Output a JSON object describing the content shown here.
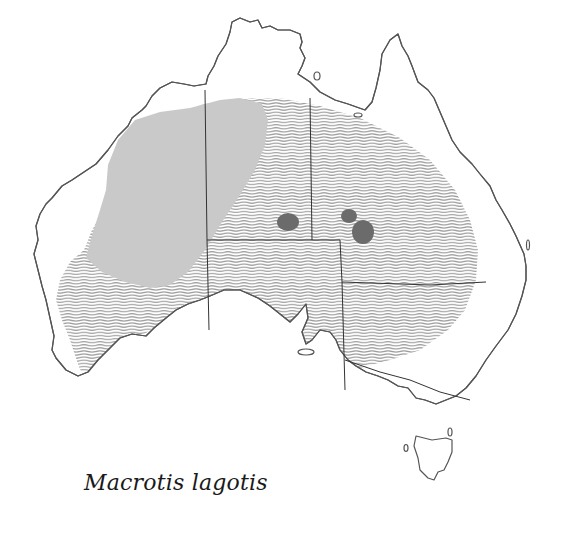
{
  "title": "Macrotis lagotis",
  "caption": "Macrotis lagotis",
  "map": {
    "region": "Australia",
    "legend_semantics": {
      "hatched": "former distribution",
      "light_grey_fill": "current distribution",
      "dark_grey_spots": "isolated populations"
    },
    "colors": {
      "coastline": "#555555",
      "state_borders": "#333333",
      "hatch_lines": "#9a9a9a",
      "current_range_fill": "#c9c9c9",
      "isolated_population_fill": "#6b6b6b",
      "background": "#ffffff"
    },
    "isolated_populations": [
      {
        "cx": 288,
        "cy": 222,
        "rx": 11,
        "ry": 9
      },
      {
        "cx": 349,
        "cy": 216,
        "rx": 8,
        "ry": 7
      },
      {
        "cx": 363,
        "cy": 232,
        "rx": 11,
        "ry": 12
      }
    ]
  }
}
